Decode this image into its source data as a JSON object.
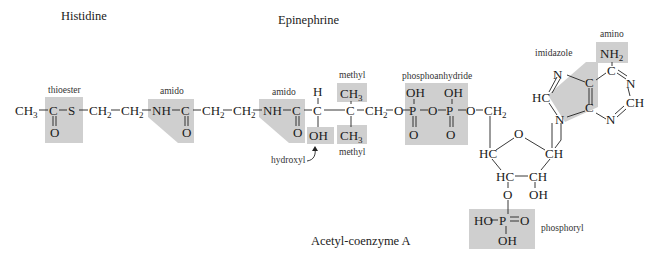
{
  "titles": {
    "histidine": "Histidine",
    "epinephrine": "Epinephrine",
    "acetyl_coa": "Acetyl-coenzyme A"
  },
  "group_labels": {
    "thioester": "thioester",
    "amido_1": "amido",
    "amido_2": "amido",
    "methyl_top": "methyl",
    "methyl_bottom": "methyl",
    "hydroxyl": "hydroxyl",
    "phosphoanhydride": "phosphoanhydride",
    "imidazole": "imidazole",
    "amino": "amino",
    "phosphoryl": "phosphoryl"
  },
  "atoms": {
    "ch3": "CH",
    "ch3_sub": "3",
    "c1": "C",
    "o1": "O",
    "s": "S",
    "ch2_a": "CH",
    "ch2_b": "CH",
    "ch2_sub": "2",
    "nh_1": "NH",
    "c2": "C",
    "o2": "O",
    "ch2_c": "CH",
    "ch2_d": "CH",
    "nh_2": "NH",
    "c3": "C",
    "o3": "O",
    "c4": "C",
    "h4": "H",
    "oh4": "OH",
    "c5": "C",
    "ch3_top": "CH",
    "ch3_bot": "CH",
    "ch2_e": "CH",
    "o_link1": "O",
    "p1": "P",
    "oh_p1": "OH",
    "o_p1": "O",
    "o_bridge": "O",
    "p2": "P",
    "oh_p2": "OH",
    "o_p2": "O",
    "o_link2": "O",
    "ch2_f": "CH",
    "ring_o": "O",
    "hc_1": "HC",
    "ch_1": "CH",
    "hc_2": "HC",
    "ch_2": "CH",
    "oh_ribose": "OH",
    "o_3p": "O",
    "ho_p3": "HO",
    "p3": "P",
    "o_p3": "O",
    "oh_p3": "OH",
    "im_n1": "N",
    "im_hc": "HC",
    "im_n9": "N",
    "c4a": "C",
    "c5a": "C",
    "c6": "C",
    "nh2": "NH",
    "nh2_sub": "2",
    "n1": "N",
    "ch_2pur": "CH",
    "n3": "N"
  },
  "colors": {
    "highlight": "#cfcfcf",
    "ink": "#1a1a1a"
  }
}
